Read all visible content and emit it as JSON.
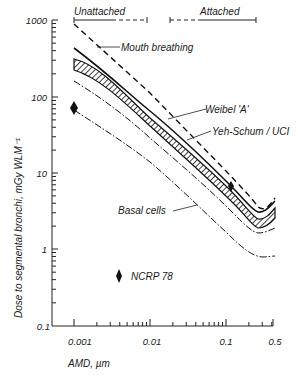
{
  "chart_data": {
    "type": "line",
    "title": "",
    "xlabel": "AMD, µm",
    "ylabel": "Dose to segmental bronchi, mGy WLM⁻¹",
    "xscale": "log",
    "yscale": "log",
    "xlim": [
      0.0007,
      0.5
    ],
    "ylim": [
      0.1,
      1000
    ],
    "x_ticks": [
      "0.001",
      "0.01",
      "0.1",
      "0.5"
    ],
    "y_ticks": [
      "0.1",
      "1",
      "10",
      "100",
      "1000"
    ],
    "grid": false,
    "legend_position": "inline annotations",
    "regions": [
      {
        "label": "Unattached",
        "x_range": [
          0.001,
          0.02
        ],
        "style": "dashed bracket"
      },
      {
        "label": "Attached",
        "x_range": [
          0.02,
          0.5
        ],
        "style": "bracket"
      }
    ],
    "series": [
      {
        "name": "Mouth breathing",
        "style": "dashed",
        "x": [
          0.001,
          0.01,
          0.1,
          0.2,
          0.3,
          0.5
        ],
        "values": [
          900,
          110,
          12,
          5,
          3.6,
          4.5
        ]
      },
      {
        "name": "Upper solid curve",
        "style": "solid",
        "x": [
          0.001,
          0.01,
          0.1,
          0.2,
          0.3,
          0.5
        ],
        "values": [
          420,
          75,
          10,
          4.5,
          3.2,
          4.0
        ]
      },
      {
        "name": "Weibel 'A'",
        "style": "hatched band upper",
        "x": [
          0.001,
          0.01,
          0.1,
          0.2,
          0.3,
          0.5
        ],
        "values": [
          300,
          60,
          8.5,
          4.0,
          2.8,
          3.4
        ]
      },
      {
        "name": "Yeh-Schum / UCI",
        "style": "hatched band lower",
        "x": [
          0.001,
          0.01,
          0.1,
          0.2,
          0.3,
          0.5
        ],
        "values": [
          210,
          48,
          7,
          3.1,
          2.3,
          2.6
        ]
      },
      {
        "name": "Dash-dot curve",
        "style": "dash-dot",
        "x": [
          0.001,
          0.01,
          0.1,
          0.2,
          0.3,
          0.5
        ],
        "values": [
          150,
          33,
          5,
          2.4,
          1.8,
          2.0
        ]
      },
      {
        "name": "Basal cells",
        "style": "dash-dot",
        "x": [
          0.001,
          0.01,
          0.1,
          0.2,
          0.3,
          0.5
        ],
        "values": [
          65,
          16,
          2.2,
          1.1,
          0.85,
          0.8
        ]
      }
    ],
    "points": [
      {
        "name": "Diamond marker (left)",
        "x": 0.001,
        "y": 140
      },
      {
        "name": "Diamond marker on band",
        "x": 0.12,
        "y": 6
      },
      {
        "name": "NCRP 78",
        "x": 0.004,
        "y": 0.28
      }
    ],
    "annotations": [
      "Unattached",
      "Attached",
      "Mouth breathing",
      "Weibel 'A'",
      "Yeh-Schum / UCI",
      "Basal cells",
      "NCRP 78"
    ]
  },
  "labels": {
    "unattached": "Unattached",
    "attached": "Attached",
    "mouth": "Mouth breathing",
    "weibel": "Weibel 'A'",
    "yeh": "Yeh-Schum / UCI",
    "basal": "Basal cells",
    "ncrp": "NCRP 78",
    "xlabel": "AMD, µm",
    "ylabel": "Dose to segmental bronchi,  mGy WLM⁻¹",
    "y_ticks": [
      "1000",
      "100",
      "10",
      "1",
      "0.1"
    ],
    "x_ticks": [
      "0.001",
      "0.01",
      "0.1",
      "0.5"
    ]
  }
}
